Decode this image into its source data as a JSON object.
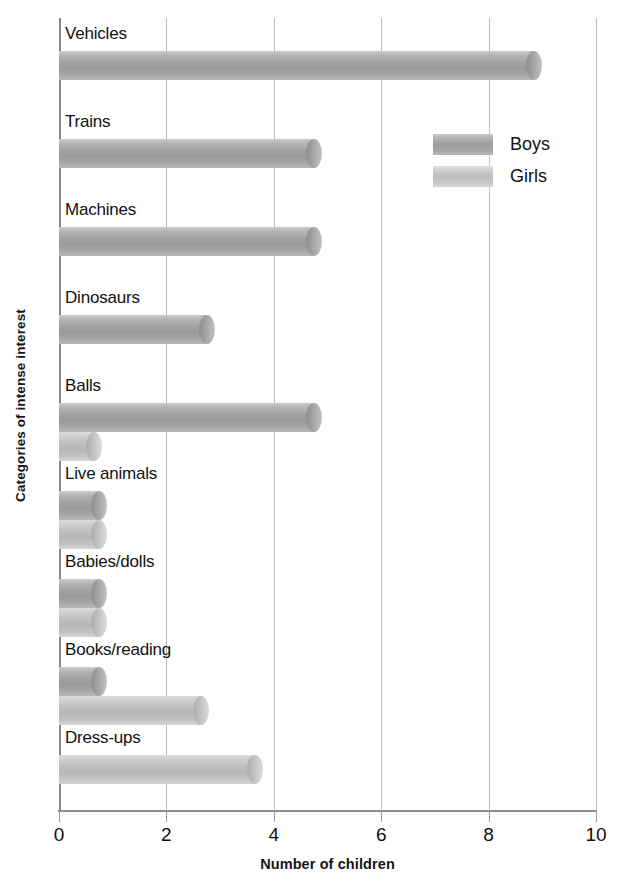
{
  "chart_data": {
    "type": "bar",
    "orientation": "horizontal",
    "title": "",
    "xlabel": "Number of children",
    "ylabel": "Categories of intense interest",
    "xlim": [
      0,
      10
    ],
    "xticks": [
      0,
      2,
      4,
      6,
      8,
      10
    ],
    "grid": true,
    "legend_position": "upper right",
    "categories": [
      "Vehicles",
      "Trains",
      "Machines",
      "Dinosaurs",
      "Balls",
      "Live animals",
      "Babies/dolls",
      "Books/reading",
      "Dress-ups"
    ],
    "series": [
      {
        "name": "Boys",
        "color": "#9f9f9f",
        "values": [
          9.0,
          4.9,
          4.9,
          2.9,
          4.9,
          0.9,
          0.9,
          0.9,
          0.0
        ]
      },
      {
        "name": "Girls",
        "color": "#c4c4c4",
        "values": [
          0.0,
          0.0,
          0.0,
          0.0,
          0.8,
          0.9,
          0.9,
          2.8,
          3.8
        ]
      }
    ]
  },
  "legend": {
    "entries": [
      {
        "label": "Boys",
        "swatch": "boys-swatch"
      },
      {
        "label": "Girls",
        "swatch": "girls-swatch"
      }
    ]
  },
  "axis": {
    "x_title": "Number of children",
    "y_title": "Categories of intense interest",
    "x_tick_labels": [
      "0",
      "2",
      "4",
      "6",
      "8",
      "10"
    ]
  }
}
